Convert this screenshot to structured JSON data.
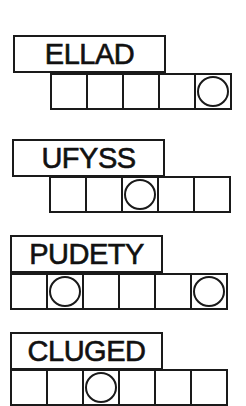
{
  "puzzles": [
    {
      "scrambled": "ELLAD",
      "cells": 5,
      "circled": [
        5
      ]
    },
    {
      "scrambled": "UFYSS",
      "cells": 5,
      "circled": [
        3
      ]
    },
    {
      "scrambled": "PUDETY",
      "cells": 6,
      "circled": [
        2,
        6
      ]
    },
    {
      "scrambled": "CLUGED",
      "cells": 6,
      "circled": [
        3
      ]
    }
  ]
}
